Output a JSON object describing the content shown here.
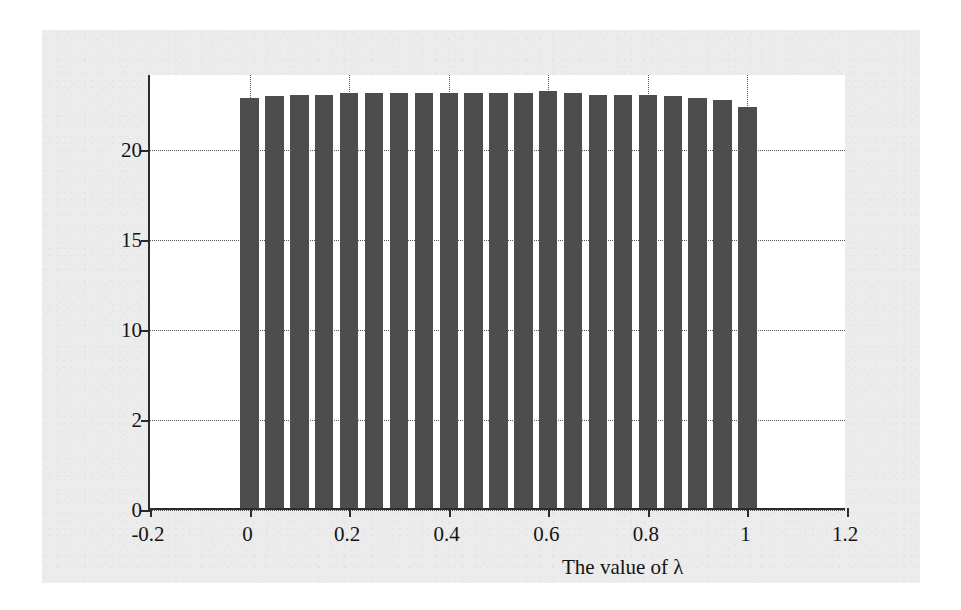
{
  "chart_data": {
    "type": "bar",
    "title": "",
    "xlabel": "The value of λ",
    "ylabel": "Utility on flow level",
    "xlim": [
      -0.2,
      1.2
    ],
    "ylim": [
      0,
      24.2
    ],
    "grid": true,
    "legend": null,
    "bar_color": "#4d4d4d",
    "bar_width": 0.037,
    "xtick_labels": [
      "-0.2",
      "0",
      "0.2",
      "0.4",
      "0.6",
      "0.8",
      "1",
      "1.2"
    ],
    "xtick_values": [
      -0.2,
      0,
      0.2,
      0.4,
      0.6,
      0.8,
      1.0,
      1.2
    ],
    "ytick_labels": [
      "0",
      "2",
      "10",
      "15",
      "20"
    ],
    "ytick_values": [
      0,
      5,
      10,
      15,
      20
    ],
    "categories": [
      "0",
      "0.05",
      "0.1",
      "0.15",
      "0.2",
      "0.25",
      "0.3",
      "0.35",
      "0.4",
      "0.45",
      "0.5",
      "0.55",
      "0.6",
      "0.65",
      "0.7",
      "0.75",
      "0.8",
      "0.85",
      "0.9",
      "0.95",
      "1"
    ],
    "x": [
      0,
      0.05,
      0.1,
      0.15,
      0.2,
      0.25,
      0.3,
      0.35,
      0.4,
      0.45,
      0.5,
      0.55,
      0.6,
      0.65,
      0.7,
      0.75,
      0.8,
      0.85,
      0.9,
      0.95,
      1.0
    ],
    "values": [
      22.8,
      22.9,
      23.0,
      23.0,
      23.1,
      23.1,
      23.1,
      23.1,
      23.1,
      23.1,
      23.1,
      23.1,
      23.2,
      23.1,
      23.0,
      23.0,
      23.0,
      22.9,
      22.8,
      22.7,
      22.3
    ]
  },
  "figure": {
    "background_color": "#ececec",
    "plot_background_color": "#ffffff",
    "axis_color": "#2b2b2b",
    "grid_color": "#555555"
  }
}
